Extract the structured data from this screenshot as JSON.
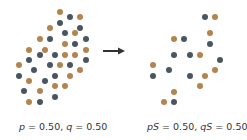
{
  "colors": {
    "orange": "#b5834e",
    "dark": "#4a5560",
    "arrow": "#333333"
  },
  "left_panel": {
    "caption": {
      "p_label": "p",
      "p_value": " = 0.50, ",
      "q_label": "q",
      "q_value": " = 0.50"
    },
    "dots": [
      [
        60,
        12,
        "orange"
      ],
      [
        70,
        17,
        "dark"
      ],
      [
        80,
        17,
        "orange"
      ],
      [
        60,
        23,
        "dark"
      ],
      [
        80,
        28,
        "dark"
      ],
      [
        50,
        28,
        "orange"
      ],
      [
        65,
        33,
        "dark"
      ],
      [
        75,
        33,
        "orange"
      ],
      [
        40,
        39,
        "orange"
      ],
      [
        50,
        39,
        "dark"
      ],
      [
        86,
        39,
        "dark"
      ],
      [
        65,
        44,
        "orange"
      ],
      [
        75,
        44,
        "dark"
      ],
      [
        29,
        50,
        "orange"
      ],
      [
        45,
        50,
        "orange"
      ],
      [
        86,
        50,
        "orange"
      ],
      [
        40,
        55,
        "dark"
      ],
      [
        55,
        55,
        "dark"
      ],
      [
        65,
        55,
        "orange"
      ],
      [
        75,
        55,
        "orange"
      ],
      [
        29,
        60,
        "dark"
      ],
      [
        86,
        60,
        "dark"
      ],
      [
        19,
        65,
        "orange"
      ],
      [
        50,
        65,
        "dark"
      ],
      [
        60,
        65,
        "orange"
      ],
      [
        70,
        65,
        "dark"
      ],
      [
        34,
        70,
        "dark"
      ],
      [
        80,
        70,
        "orange"
      ],
      [
        19,
        76,
        "dark"
      ],
      [
        55,
        76,
        "dark"
      ],
      [
        70,
        76,
        "orange"
      ],
      [
        29,
        81,
        "orange"
      ],
      [
        45,
        81,
        "dark"
      ],
      [
        55,
        86,
        "orange"
      ],
      [
        65,
        86,
        "orange"
      ],
      [
        24,
        91,
        "dark"
      ],
      [
        40,
        91,
        "orange"
      ],
      [
        55,
        97,
        "dark"
      ],
      [
        29,
        102,
        "orange"
      ],
      [
        40,
        102,
        "dark"
      ]
    ]
  },
  "right_panel": {
    "caption": {
      "p_label": "pS",
      "p_value": " = 0.50, ",
      "q_label": "qS",
      "q_value": " = 0.50"
    },
    "dots": [
      [
        205,
        17,
        "dark"
      ],
      [
        215,
        17,
        "orange"
      ],
      [
        210,
        33,
        "orange"
      ],
      [
        174,
        39,
        "orange"
      ],
      [
        184,
        39,
        "dark"
      ],
      [
        210,
        44,
        "dark"
      ],
      [
        174,
        55,
        "dark"
      ],
      [
        190,
        55,
        "dark"
      ],
      [
        200,
        55,
        "orange"
      ],
      [
        220,
        60,
        "dark"
      ],
      [
        153,
        65,
        "orange"
      ],
      [
        169,
        70,
        "dark"
      ],
      [
        215,
        70,
        "orange"
      ],
      [
        153,
        76,
        "dark"
      ],
      [
        190,
        76,
        "dark"
      ],
      [
        205,
        76,
        "orange"
      ],
      [
        200,
        86,
        "orange"
      ],
      [
        174,
        92,
        "orange"
      ],
      [
        164,
        102,
        "orange"
      ],
      [
        174,
        102,
        "dark"
      ]
    ]
  },
  "arrow": {
    "icon": "right-arrow-icon"
  }
}
